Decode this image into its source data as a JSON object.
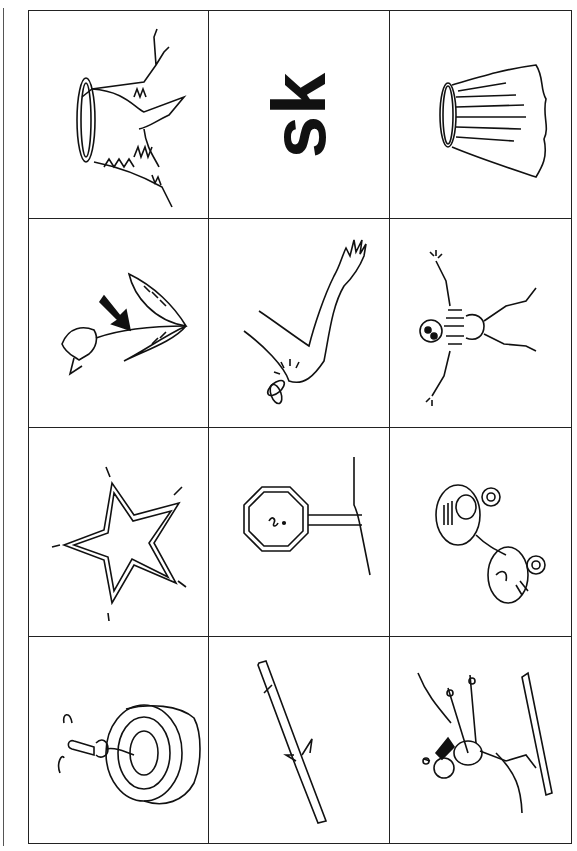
{
  "worksheet": {
    "heading_letters": "sk",
    "orientation": "rotated-90",
    "colors": {
      "ink": "#111111",
      "paper": "#ffffff",
      "grid": "#222222"
    },
    "cells": [
      {
        "row": 1,
        "col": 1,
        "picture": "tree-stump"
      },
      {
        "row": 1,
        "col": 2,
        "text": "sk"
      },
      {
        "row": 1,
        "col": 3,
        "picture": "skirt"
      },
      {
        "row": 2,
        "col": 1,
        "picture": "tulip-stem"
      },
      {
        "row": 2,
        "col": 2,
        "picture": "arm-mosquito-sting"
      },
      {
        "row": 2,
        "col": 3,
        "picture": "skeleton"
      },
      {
        "row": 3,
        "col": 1,
        "picture": "star"
      },
      {
        "row": 3,
        "col": 2,
        "picture": "stop-sign"
      },
      {
        "row": 3,
        "col": 3,
        "picture": "roller-skates"
      },
      {
        "row": 4,
        "col": 1,
        "picture": "tape-roll"
      },
      {
        "row": 4,
        "col": 2,
        "picture": "stick"
      },
      {
        "row": 4,
        "col": 3,
        "picture": "skier"
      }
    ]
  }
}
